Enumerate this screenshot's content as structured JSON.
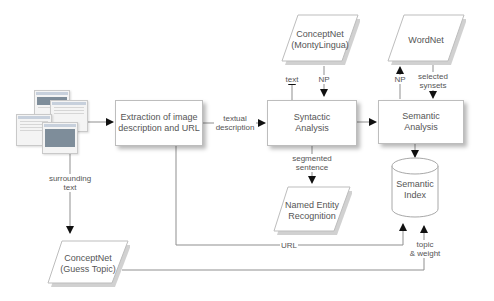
{
  "diagram": {
    "nodes": {
      "web_pages": {
        "label": "",
        "kind": "image-web-pages"
      },
      "extraction": {
        "label_line1": "Extraction of image",
        "label_line2": "description and URL"
      },
      "syntactic": {
        "label_line1": "Syntactic",
        "label_line2": "Analysis"
      },
      "semantic": {
        "label_line1": "Semantic",
        "label_line2": "Analysis"
      },
      "conceptnet_monty": {
        "label_line1": "ConceptNet",
        "label_line2": "(MontyLingua)"
      },
      "wordnet": {
        "label_line1": "WordNet"
      },
      "ner": {
        "label_line1": "Named Entity",
        "label_line2": "Recognition"
      },
      "semantic_index": {
        "label_line1": "Semantic",
        "label_line2": "Index"
      },
      "conceptnet_guess": {
        "label_line1": "ConceptNet",
        "label_line2": "(Guess Topic)"
      }
    },
    "edges": {
      "textual_description": {
        "line1": "textual",
        "line2": "description"
      },
      "text": {
        "line1": "text"
      },
      "np_monty": {
        "line1": "NP"
      },
      "np_wordnet": {
        "line1": "NP"
      },
      "selected_synsets": {
        "line1": "selected",
        "line2": "synsets"
      },
      "segmented_sentence": {
        "line1": "segmented",
        "line2": "sentence"
      },
      "surrounding_text": {
        "line1": "surrounding",
        "line2": "text"
      },
      "url": {
        "line1": "URL"
      },
      "topic_weight": {
        "line1": "topic",
        "line2": "& weight"
      }
    },
    "colors": {
      "line": "#8a8a8a",
      "arrow": "#111111",
      "border": "#bdbdbd",
      "text": "#555555"
    }
  }
}
